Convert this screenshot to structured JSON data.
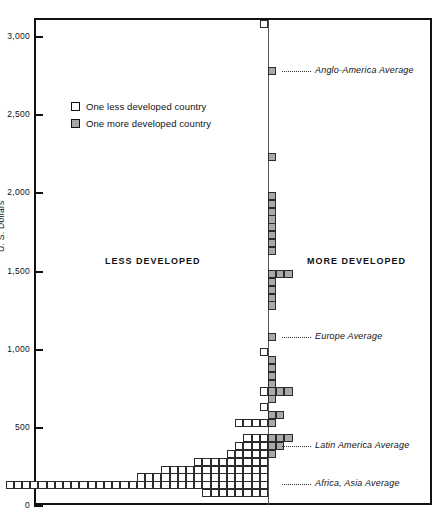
{
  "chart_data": {
    "type": "bar",
    "title": "",
    "subtitle": "",
    "orientation": "horizontal-pyramid-histogram",
    "xlabel": "",
    "ylabel": "U. S. Dollars",
    "ylim": [
      0,
      3200
    ],
    "grid": false,
    "legend_position": "upper-left-inside",
    "bin_size": 50,
    "cell_unit": "one country",
    "y_ticks": [
      {
        "value": 3000,
        "label": "3,000"
      },
      {
        "value": 2500,
        "label": "2,500"
      },
      {
        "value": 2000,
        "label": "2,000"
      },
      {
        "value": 1500,
        "label": "1,500"
      },
      {
        "value": 1000,
        "label": "1,000"
      },
      {
        "value": 500,
        "label": "500"
      },
      {
        "value": 0,
        "label": "0"
      }
    ],
    "legend": [
      {
        "key": "less",
        "label": "One less developed country",
        "fill": "#ffffff",
        "stroke": "#111111"
      },
      {
        "key": "more",
        "label": "One more developed country",
        "fill": "#a8a8a8",
        "stroke": "#111111"
      }
    ],
    "side_headings": [
      {
        "key": "less",
        "label": "LESS DEVELOPED"
      },
      {
        "key": "more",
        "label": "MORE DEVELOPED"
      }
    ],
    "annotations": [
      {
        "key": "anglo-america",
        "label": "Anglo-America Average",
        "value": 2750
      },
      {
        "key": "europe",
        "label": "Europe Average",
        "value": 1050
      },
      {
        "key": "latin-america",
        "label": "Latin America Average",
        "value": 350
      },
      {
        "key": "africa-asia",
        "label": "Africa, Asia Average",
        "value": 110
      }
    ],
    "series": [
      {
        "name": "One less developed country",
        "key": "less",
        "side": "left"
      },
      {
        "name": "One more developed country",
        "key": "more",
        "side": "right"
      }
    ],
    "rows": [
      {
        "value": 3050,
        "less": 1,
        "more": 0
      },
      {
        "value": 2750,
        "less": 0,
        "more": 1
      },
      {
        "value": 2200,
        "less": 0,
        "more": 1
      },
      {
        "value": 1950,
        "less": 0,
        "more": 1
      },
      {
        "value": 1900,
        "less": 0,
        "more": 1
      },
      {
        "value": 1850,
        "less": 0,
        "more": 1
      },
      {
        "value": 1800,
        "less": 0,
        "more": 1
      },
      {
        "value": 1750,
        "less": 0,
        "more": 1
      },
      {
        "value": 1700,
        "less": 0,
        "more": 1
      },
      {
        "value": 1650,
        "less": 0,
        "more": 1
      },
      {
        "value": 1600,
        "less": 0,
        "more": 1
      },
      {
        "value": 1450,
        "less": 0,
        "more": 3
      },
      {
        "value": 1400,
        "less": 0,
        "more": 1
      },
      {
        "value": 1350,
        "less": 0,
        "more": 1
      },
      {
        "value": 1300,
        "less": 0,
        "more": 1
      },
      {
        "value": 1250,
        "less": 0,
        "more": 1
      },
      {
        "value": 1050,
        "less": 0,
        "more": 1
      },
      {
        "value": 950,
        "less": 1,
        "more": 0
      },
      {
        "value": 900,
        "less": 0,
        "more": 1
      },
      {
        "value": 850,
        "less": 0,
        "more": 1
      },
      {
        "value": 800,
        "less": 0,
        "more": 1
      },
      {
        "value": 750,
        "less": 0,
        "more": 1
      },
      {
        "value": 700,
        "less": 1,
        "more": 3
      },
      {
        "value": 650,
        "less": 0,
        "more": 1
      },
      {
        "value": 600,
        "less": 1,
        "more": 0
      },
      {
        "value": 550,
        "less": 0,
        "more": 2
      },
      {
        "value": 500,
        "less": 4,
        "more": 1
      },
      {
        "value": 400,
        "less": 3,
        "more": 3
      },
      {
        "value": 350,
        "less": 4,
        "more": 2
      },
      {
        "value": 300,
        "less": 5,
        "more": 1
      },
      {
        "value": 250,
        "less": 9,
        "more": 0
      },
      {
        "value": 200,
        "less": 13,
        "more": 0
      },
      {
        "value": 150,
        "less": 16,
        "more": 0
      },
      {
        "value": 100,
        "less": 32,
        "more": 0
      },
      {
        "value": 50,
        "less": 8,
        "more": 0
      }
    ]
  }
}
